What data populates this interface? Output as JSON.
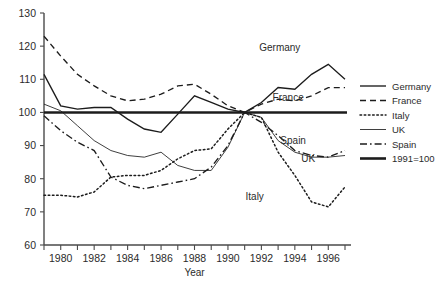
{
  "chart_data": {
    "type": "line",
    "title": "",
    "xlabel": "Year",
    "ylabel": "",
    "xlim": [
      1979,
      1997
    ],
    "ylim": [
      60,
      130
    ],
    "ytick_step": 10,
    "yticks": [
      60,
      70,
      80,
      90,
      100,
      110,
      120,
      130
    ],
    "xticks": [
      1979,
      1980,
      1981,
      1982,
      1983,
      1984,
      1985,
      1986,
      1987,
      1988,
      1989,
      1990,
      1991,
      1992,
      1993,
      1994,
      1995,
      1996,
      1997
    ],
    "xtick_labels": [
      "",
      "1980",
      "",
      "1982",
      "",
      "1984",
      "",
      "1986",
      "",
      "1988",
      "",
      "1990",
      "",
      "1992",
      "",
      "1994",
      "",
      "1996",
      ""
    ],
    "grid": false,
    "legend_position": "right",
    "x": [
      1979,
      1980,
      1981,
      1982,
      1983,
      1984,
      1985,
      1986,
      1987,
      1988,
      1989,
      1990,
      1991,
      1992,
      1993,
      1994,
      1995,
      1996,
      1997
    ],
    "series": [
      {
        "name": "Germany",
        "style": "solid",
        "values": [
          111.5,
          102.0,
          101.0,
          101.5,
          101.5,
          98.0,
          95.0,
          94.0,
          99.5,
          105.0,
          103.0,
          101.0,
          100.0,
          103.0,
          107.5,
          107.0,
          111.5,
          114.5,
          110.0
        ]
      },
      {
        "name": "France",
        "style": "dashed",
        "values": [
          123.0,
          117.0,
          111.5,
          108.0,
          105.0,
          103.5,
          104.0,
          105.5,
          108.0,
          108.5,
          105.5,
          102.0,
          100.0,
          102.5,
          104.0,
          103.5,
          105.0,
          107.5,
          107.5
        ]
      },
      {
        "name": "Italy",
        "style": "dotted",
        "values": [
          75.0,
          75.0,
          74.5,
          76.0,
          80.5,
          81.0,
          81.0,
          82.5,
          86.0,
          88.5,
          89.0,
          95.0,
          100.0,
          98.5,
          88.0,
          81.0,
          73.0,
          71.5,
          77.5
        ]
      },
      {
        "name": "UK",
        "style": "thin-solid",
        "values": [
          102.5,
          100.5,
          96.0,
          91.5,
          88.5,
          87.0,
          86.5,
          88.0,
          84.0,
          82.5,
          82.5,
          89.5,
          100.0,
          98.5,
          91.5,
          88.0,
          86.5,
          86.5,
          87.0
        ]
      },
      {
        "name": "Spain",
        "style": "dash-dot",
        "values": [
          99.0,
          94.5,
          91.0,
          88.5,
          80.5,
          78.0,
          77.0,
          78.0,
          79.0,
          80.0,
          83.5,
          90.0,
          100.0,
          97.0,
          93.0,
          88.5,
          87.0,
          86.5,
          88.5
        ]
      }
    ],
    "reference_line": {
      "name": "1991=100",
      "value": 100,
      "style": "bold-solid"
    },
    "annotations": [
      {
        "text": "Germany",
        "x": 1993.1,
        "y": 118.5
      },
      {
        "text": "France",
        "x": 1993.6,
        "y": 103.5
      },
      {
        "text": "Spain",
        "x": 1993.9,
        "y": 90.5
      },
      {
        "text": "UK",
        "x": 1994.8,
        "y": 85.0
      },
      {
        "text": "Italy",
        "x": 1991.6,
        "y": 73.5
      }
    ]
  },
  "legend": {
    "items": [
      {
        "label": "Germany",
        "style": "solid"
      },
      {
        "label": "France",
        "style": "dashed"
      },
      {
        "label": "Italy",
        "style": "dotted"
      },
      {
        "label": "UK",
        "style": "thin-solid"
      },
      {
        "label": "Spain",
        "style": "dash-dot"
      },
      {
        "label": "1991=100",
        "style": "bold-solid"
      }
    ]
  },
  "axis": {
    "x_title": "Year",
    "y_tick_0": "60",
    "y_tick_1": "70",
    "y_tick_2": "80",
    "y_tick_3": "90",
    "y_tick_4": "100",
    "y_tick_5": "110",
    "y_tick_6": "120",
    "y_tick_7": "130"
  },
  "colors": {
    "ink": "#1c1c1c",
    "axis": "#4a4a4a",
    "background": "#ffffff"
  }
}
